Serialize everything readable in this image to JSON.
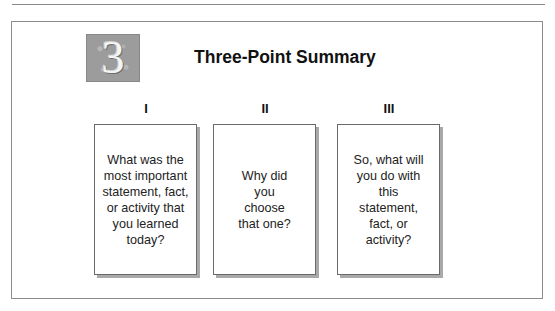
{
  "header": {
    "icon_number": "3",
    "title": "Three-Point Summary"
  },
  "columns": [
    {
      "numeral": "I",
      "prompt": "What was the most important statement, fact, or activity that you learned today?"
    },
    {
      "numeral": "II",
      "prompt": "Why did you choose that one?"
    },
    {
      "numeral": "III",
      "prompt": "So, what will you do with this statement, fact, or activity?"
    }
  ]
}
